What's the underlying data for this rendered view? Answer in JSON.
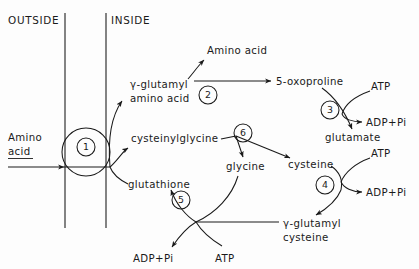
{
  "diagram": {
    "compartments": {
      "outside_label": "OUTSIDE",
      "inside_label": "INSIDE"
    },
    "colors": {
      "ink": "#1a1a1a",
      "membrane": "#3a3a3a",
      "background": "#fdfdfd"
    },
    "species": {
      "amino_acid_outside_line1": "Amino",
      "amino_acid_outside_line2": "acid",
      "amino_acid_released": "Amino  acid",
      "gamma_glutamyl_amino_acid_line1": "γ-glutamyl",
      "gamma_glutamyl_amino_acid_line2": "amino acid",
      "oxoproline": "5-oxoproline",
      "glutamate": "glutamate",
      "cysteinylglycine": "cysteinylglycine",
      "glycine": "glycine",
      "cysteine": "cysteine",
      "glutathione": "glutathione",
      "gamma_glutamyl_cysteine_line1": "γ-glutamyl",
      "gamma_glutamyl_cysteine_line2": "cysteine"
    },
    "cofactors": {
      "atp_step3": "ATP",
      "adp_pi_step3": "ADP+Pi",
      "atp_step4": "ATP",
      "adp_pi_step4": "ADP+Pi",
      "atp_step5": "ATP",
      "adp_pi_step5": "ADP+Pi"
    },
    "enzyme_steps": [
      {
        "number": "1",
        "name": "gamma-glutamyl-transpeptidase-transporter"
      },
      {
        "number": "2",
        "name": "gamma-glutamyl-cyclotransferase"
      },
      {
        "number": "3",
        "name": "5-oxoprolinase"
      },
      {
        "number": "4",
        "name": "gamma-glutamylcysteine-synthetase"
      },
      {
        "number": "5",
        "name": "glutathione-synthetase"
      },
      {
        "number": "6",
        "name": "cysteinylglycinase"
      }
    ]
  }
}
